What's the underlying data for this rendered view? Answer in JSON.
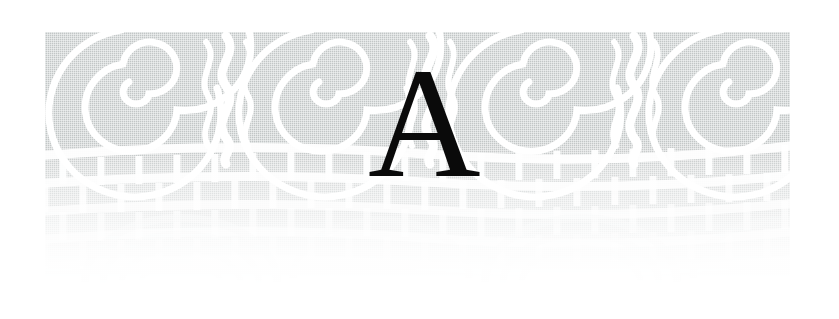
{
  "page": {
    "width": 839,
    "height": 319,
    "background_color": "#ffffff",
    "kind": "book-chapter-opening-ornament"
  },
  "dropcap": {
    "letter": "A",
    "color": "#0a0a0a",
    "style": "serif-capital"
  },
  "ornament": {
    "description": "Decorative woven/basketry band used as a chapter header",
    "ink_color": "#c2c6c6",
    "highlight_color": "#ffffff",
    "band_left": 45,
    "band_top": 32,
    "band_width": 745,
    "band_height": 263,
    "spiral_count": 4,
    "spiral_centers_x": [
      131,
      321,
      531,
      731
    ],
    "spiral_center_y": 88,
    "divider_count": 3,
    "divider_centers_x": [
      226,
      430,
      634
    ],
    "lattice_rows": 4,
    "fade_direction": "top-opaque-to-bottom-transparent"
  }
}
